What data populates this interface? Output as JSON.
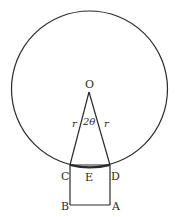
{
  "diagram": {
    "type": "geometry",
    "circle": {
      "center_label": "O",
      "cx": 89.5,
      "cy": 89,
      "r": 78
    },
    "points": {
      "O": {
        "label": "O",
        "x": 89,
        "y": 92
      },
      "C": {
        "label": "C",
        "x": 70,
        "y": 165
      },
      "D": {
        "label": "D",
        "x": 110,
        "y": 165
      },
      "B": {
        "label": "B",
        "x": 70,
        "y": 205
      },
      "A": {
        "label": "A",
        "x": 110,
        "y": 205
      },
      "E": {
        "label": "E"
      }
    },
    "labels": {
      "angle": "2θ",
      "side_left": "r",
      "side_right": "r"
    },
    "colors": {
      "stroke": "#2a2a2a",
      "background": "#ffffff"
    }
  }
}
